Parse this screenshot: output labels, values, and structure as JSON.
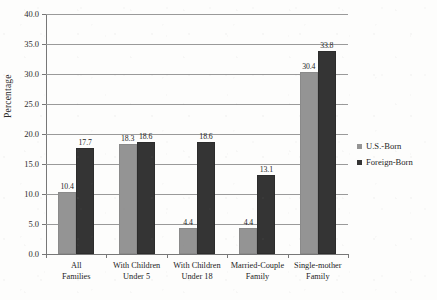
{
  "chart_data": {
    "type": "bar",
    "title": "",
    "xlabel": "",
    "ylabel": "Percentage",
    "ylim": [
      0.0,
      40.0
    ],
    "ytick_step": 5.0,
    "ytick_labels": [
      "40.0",
      "35.0",
      "30.0",
      "25.0",
      "20.0",
      "15.0",
      "10.0",
      "5.0",
      "0.0"
    ],
    "ytick_values": [
      40.0,
      35.0,
      30.0,
      25.0,
      20.0,
      15.0,
      10.0,
      5.0,
      0.0
    ],
    "grid": true,
    "grid_axis": "y",
    "legend_position": "right",
    "categories": [
      "All Families",
      "With Children Under 5",
      "With Children Under 18",
      "Married-Couple Family",
      "Single-mother Family"
    ],
    "category_lines": [
      [
        "All",
        "Families"
      ],
      [
        "With Children",
        "Under 5"
      ],
      [
        "With Children",
        "Under 18"
      ],
      [
        "Married-Couple",
        "Family"
      ],
      [
        "Single-mother",
        "Family"
      ]
    ],
    "series": [
      {
        "name": "U.S.-Born",
        "color": "#949494",
        "values": [
          10.4,
          18.3,
          4.4,
          4.4,
          30.4
        ],
        "labels": [
          "10.4",
          "18.3",
          "4.4",
          "4.4",
          "30.4"
        ]
      },
      {
        "name": "Foreign-Born",
        "color": "#343434",
        "values": [
          17.7,
          18.6,
          18.6,
          13.1,
          33.8
        ],
        "labels": [
          "17.7",
          "18.6",
          "18.6",
          "13.1",
          "33.8"
        ]
      }
    ]
  },
  "legend": {
    "items": [
      {
        "label": "U.S.-Born",
        "color": "#949494"
      },
      {
        "label": "Foreign-Born",
        "color": "#343434"
      }
    ]
  },
  "axis": {
    "y_title": "Percentage"
  }
}
